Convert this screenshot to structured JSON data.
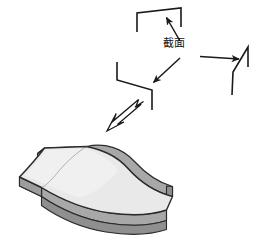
{
  "figure": {
    "type": "technical-diagram",
    "background_color": "#ffffff",
    "stroke_color": "#1a1a1a",
    "labels": {
      "cross_section": "截面"
    },
    "profiles": [
      {
        "name": "top-profile",
        "label": "upper cross-section profile",
        "stroke": "#1a1a1a",
        "points": "[[137,32],[137,13],[181,8],[181,27]]"
      },
      {
        "name": "middle-profile",
        "label": "middle cross-section profile",
        "stroke": "#1a1a1a",
        "points": "[[117,62],[117,80],[152,90],[152,110]]"
      },
      {
        "name": "right-profile",
        "label": "right cross-section profile",
        "stroke": "#1a1a1a",
        "points": "[[232,95],[234,72],[248,48],[248,66]]"
      }
    ],
    "arrows": [
      {
        "name": "leader-arrow-top",
        "label": "pointer from cross-section label to upper profile",
        "style": "thin-solid",
        "from": "[178,42]",
        "to": "[166,17]"
      },
      {
        "name": "leader-arrow-middle",
        "label": "pointer from cross-section label to middle profile",
        "style": "thin-solid",
        "from": "[178,59]",
        "to": "[152,83]"
      },
      {
        "name": "transfer-arrow-right",
        "label": "horizontal pointer to right profile",
        "style": "thin-solid",
        "from": "[200,57]",
        "to": "[238,59]"
      },
      {
        "name": "sweep-arrow",
        "label": "hollow outline arrow from profiles to solid surface",
        "style": "hollow-outline",
        "from": "[140,103]",
        "to": "[107,130]"
      }
    ],
    "solid": {
      "name": "swept-surface",
      "label": "swept saddle surface generated from the cross-sections",
      "top_face_color": "#e9e9e9",
      "side_face_color": "#a8a8a8",
      "edge_color": "#2b2b2b"
    },
    "colors": {
      "ink": "#1a1a1a",
      "top_face": "#e9e9e9",
      "top_face_light": "#f0f0f0",
      "side_face": "#a8a8a8",
      "side_face_dark": "#9a9a9a",
      "edge": "#2b2b2b"
    }
  }
}
